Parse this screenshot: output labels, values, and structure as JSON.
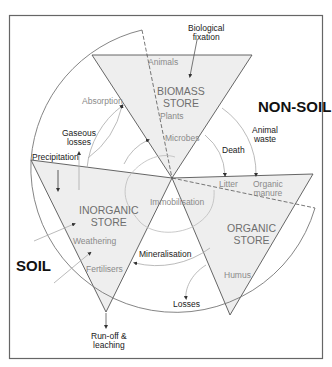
{
  "diagram": {
    "regions": {
      "non_soil": "NON-SOIL",
      "soil": "SOIL"
    },
    "stores": {
      "biomass": [
        "BIOMASS",
        "STORE"
      ],
      "inorganic": [
        "INORGANIC",
        "STORE"
      ],
      "organic": [
        "ORGANIC",
        "STORE"
      ]
    },
    "store_contents": {
      "animals": "Animals",
      "plants": "Plants",
      "microbes": "Microbes",
      "litter": "Litter",
      "organic_manure": [
        "Organic",
        "manure"
      ],
      "humus": "Humus",
      "weathering": "Weathering",
      "fertilisers": "Fertilisers"
    },
    "flows": {
      "biological_fixation": [
        "Biological",
        "fixation"
      ],
      "absorption": "Absorption",
      "gaseous_losses": [
        "Gaseous",
        "losses"
      ],
      "precipitation": "Precipitation",
      "animal_waste": [
        "Animal",
        "waste"
      ],
      "death": "Death",
      "immobilisation": "Immobilisation",
      "mineralisation": "Mineralisation",
      "losses": "Losses",
      "runoff_leaching": [
        "Run-off &",
        "leaching"
      ]
    },
    "colors": {
      "store_fill": "#eeeeee",
      "line": "#555555",
      "arc": "#9a9a9a",
      "frame": "#666666"
    }
  }
}
